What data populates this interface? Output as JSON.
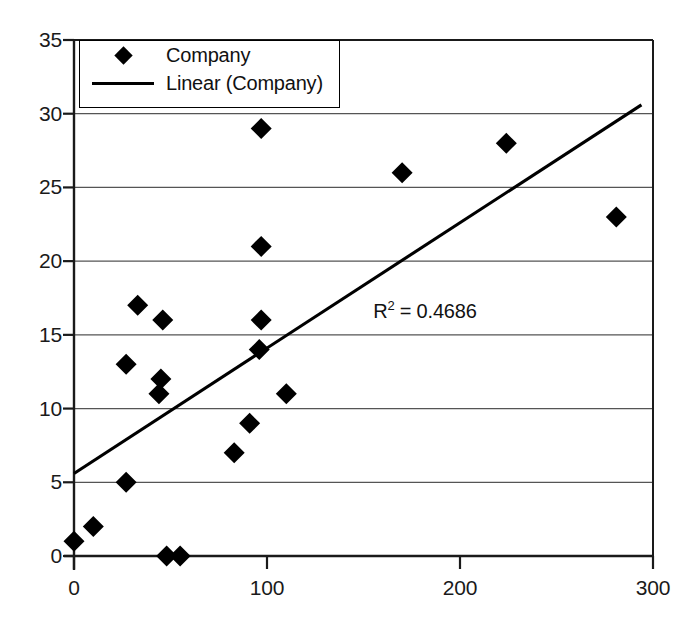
{
  "chart_data": {
    "type": "scatter",
    "title": "",
    "xlabel": "",
    "ylabel": "",
    "xlim": [
      0,
      300
    ],
    "ylim": [
      0,
      35
    ],
    "grid": "horizontal",
    "legend_position": "top-left-inside",
    "x_ticks": [
      "0",
      "100",
      "200",
      "300"
    ],
    "x_tick_values": [
      0,
      100,
      200,
      300
    ],
    "y_ticks": [
      "0",
      "5",
      "10",
      "15",
      "20",
      "25",
      "30",
      "35"
    ],
    "y_tick_values": [
      0,
      5,
      10,
      15,
      20,
      25,
      30,
      35
    ],
    "series": [
      {
        "name": "Company",
        "marker": "diamond",
        "color": "#000000",
        "points": [
          {
            "x": 0,
            "y": 1
          },
          {
            "x": 10,
            "y": 2
          },
          {
            "x": 27,
            "y": 5
          },
          {
            "x": 27,
            "y": 13
          },
          {
            "x": 33,
            "y": 17
          },
          {
            "x": 44,
            "y": 11
          },
          {
            "x": 45,
            "y": 12
          },
          {
            "x": 46,
            "y": 16
          },
          {
            "x": 48,
            "y": 0
          },
          {
            "x": 55,
            "y": 0
          },
          {
            "x": 83,
            "y": 7
          },
          {
            "x": 91,
            "y": 9
          },
          {
            "x": 96,
            "y": 14
          },
          {
            "x": 97,
            "y": 16
          },
          {
            "x": 97,
            "y": 21
          },
          {
            "x": 97,
            "y": 29
          },
          {
            "x": 110,
            "y": 11
          },
          {
            "x": 170,
            "y": 26
          },
          {
            "x": 224,
            "y": 28
          },
          {
            "x": 281,
            "y": 23
          }
        ]
      }
    ],
    "trendline": {
      "name": "Linear (Company)",
      "color": "#000000",
      "x_start": 0,
      "y_start": 5.6,
      "x_end": 294,
      "y_end": 30.6
    },
    "annotations": [
      {
        "name": "r-squared",
        "prefix": "R",
        "superscript": "2",
        "text": " = 0.4686",
        "x": 155,
        "y": 16.4
      }
    ]
  },
  "legend": {
    "entries": [
      {
        "label": "Company",
        "key": "diamond-marker"
      },
      {
        "label": "Linear (Company)",
        "key": "trend-line"
      }
    ]
  },
  "colors": {
    "axis": "#1a1a1a",
    "gridline": "#555555",
    "marker": "#000000",
    "trendline": "#000000",
    "background": "#ffffff"
  }
}
